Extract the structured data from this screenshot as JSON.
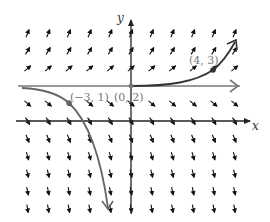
{
  "diagram": {
    "type": "slope_field",
    "equation_hint": "dy/dx = y - 2",
    "axes": {
      "x_label": "x",
      "y_label": "y",
      "x_range": [
        -5,
        5
      ],
      "y_range": [
        -5,
        5
      ]
    },
    "grid": {
      "x_values": [
        -5,
        -4,
        -3,
        -2,
        -1,
        0,
        1,
        2,
        3,
        4,
        5
      ],
      "y_values": [
        5,
        4,
        3,
        1,
        0,
        -1,
        -2,
        -3,
        -4,
        -5
      ]
    },
    "colors": {
      "axes": "#222222",
      "arrows": "#111111",
      "solution_curve": "#333333",
      "equilibrium": "#777777",
      "point_labels": "#777777"
    },
    "points": [
      {
        "x": -3,
        "y": 1,
        "label": "(−3, 1)"
      },
      {
        "x": 0,
        "y": 2,
        "label": "(0, 2)"
      },
      {
        "x": 4,
        "y": 3,
        "label": "(4, 3)"
      }
    ],
    "curves": [
      {
        "name": "solution-through-4-3",
        "description": "rising curve through (4,3)"
      },
      {
        "name": "equilibrium-y-2",
        "description": "horizontal line y = 2 through (0,2)"
      },
      {
        "name": "solution-through-minus3-1",
        "description": "falling curve through (-3,1)"
      }
    ]
  }
}
